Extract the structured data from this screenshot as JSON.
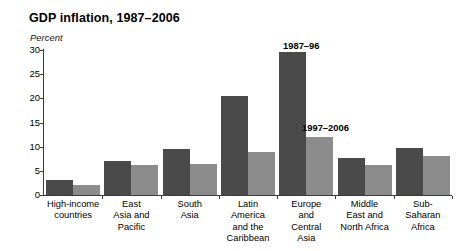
{
  "chart_data": {
    "type": "bar",
    "title": "GDP inflation, 1987–2006",
    "subtitle": "Percent",
    "xlabel": "",
    "ylabel": "Percent",
    "ylim": [
      0,
      30
    ],
    "yticks": [
      0,
      5,
      10,
      15,
      20,
      25,
      30
    ],
    "ytick_labels": [
      "0",
      "5",
      "10",
      "15",
      "20",
      "25",
      "30"
    ],
    "grid": false,
    "legend_position": "inline-annotation",
    "categories": [
      "High-income countries",
      "East Asia and Pacific",
      "South Asia",
      "Latin America and the Caribbean",
      "Europe and Central Asia",
      "Middle East and North Africa",
      "Sub-Saharan Africa"
    ],
    "category_lines": [
      [
        "High-income",
        "countries"
      ],
      [
        "East",
        "Asia and",
        "Pacific"
      ],
      [
        "South",
        "Asia"
      ],
      [
        "Latin",
        "America",
        "and the",
        "Caribbean"
      ],
      [
        "Europe",
        "and",
        "Central",
        "Asia"
      ],
      [
        "Middle",
        "East and",
        "North Africa"
      ],
      [
        "Sub-",
        "Saharan",
        "Africa"
      ]
    ],
    "series": [
      {
        "name": "1987–96",
        "color": "#4a4a4a",
        "values": [
          3.2,
          7.0,
          9.5,
          20.5,
          29.5,
          7.7,
          9.8
        ]
      },
      {
        "name": "1997–2006",
        "color": "#8c8c8c",
        "values": [
          2.0,
          6.3,
          6.5,
          9.0,
          12.0,
          6.3,
          8.1
        ]
      }
    ],
    "annotations": [
      {
        "text": "1987–96",
        "series": "1987–96"
      },
      {
        "text": "1997–2006",
        "series": "1997–2006"
      }
    ],
    "axis_color": "#3b3b3b"
  }
}
